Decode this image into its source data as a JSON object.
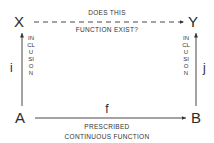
{
  "diagram": {
    "nodes": {
      "X": "X",
      "Y": "Y",
      "A": "A",
      "B": "B"
    },
    "top_edge": {
      "label_line1": "DOES THIS",
      "label_line2": "FUNCTION EXIST?",
      "style": "dashed",
      "from": "X",
      "to": "Y"
    },
    "bottom_edge": {
      "symbol": "f",
      "label_line1": "PRESCRIBED",
      "label_line2": "CONTINUOUS FUNCTION",
      "style": "solid",
      "from": "A",
      "to": "B"
    },
    "left_edge": {
      "symbol": "i",
      "label": "INCLUSION",
      "style": "solid",
      "from": "A",
      "to": "X"
    },
    "right_edge": {
      "symbol": "j",
      "label": "INCLUSION",
      "style": "solid",
      "from": "B",
      "to": "Y"
    },
    "colors": {
      "ink": "#333333",
      "background": "#ffffff"
    }
  }
}
